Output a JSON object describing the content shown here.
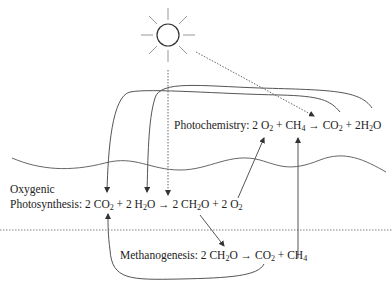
{
  "diagram": {
    "labels": {
      "photochemistry": {
        "name": "Photochemistry:",
        "equation_parts": [
          "2 O",
          "2",
          " + CH",
          "4",
          " → CO",
          "2",
          " + 2H",
          "2",
          "O"
        ]
      },
      "oxygenic": "Oxygenic",
      "photosynthesis": {
        "name": "Photosynthesis:",
        "equation_parts": [
          "2 CO",
          "2",
          " + 2 H",
          "2",
          "O → 2 CH",
          "2",
          "O + 2 O",
          "2"
        ]
      },
      "methanogenesis": {
        "name": "Methanogenesis:",
        "equation_parts": [
          "2 CH",
          "2",
          "O → CO",
          "2",
          " + CH",
          "4"
        ]
      }
    },
    "icons": {
      "sun": "sun-icon"
    },
    "colors": {
      "line": "#555555",
      "text": "#222222",
      "background": "#ffffff"
    }
  }
}
